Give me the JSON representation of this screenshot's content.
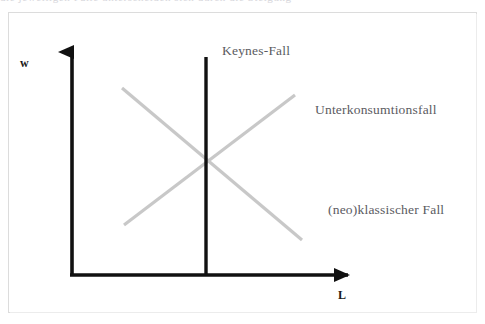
{
  "figure": {
    "kind": "economics-labour-market-diagram",
    "top_bleed_text": "die jeweiligen Fälle  unterscheiden sich durch die Steigung",
    "frame_color": "#dcdcdc",
    "background": "#ffffff"
  },
  "axes": {
    "vertical": {
      "label": "w",
      "color": "#111111",
      "x": 72,
      "y_top": 40,
      "y_bottom": 276,
      "arrow": "arrow-up"
    },
    "horizontal": {
      "label": "L",
      "color": "#111111",
      "y": 275,
      "x_left": 72,
      "x_right": 360,
      "arrow": "arrow-right"
    }
  },
  "curves": [
    {
      "name": "keynes-line",
      "description": "vertical black line",
      "color": "#111111",
      "width": 3.4,
      "x1": 206,
      "y1": 57,
      "x2": 206,
      "y2": 276
    },
    {
      "name": "labour-demand-line",
      "description": "downward sloping grey line",
      "color": "#c8c8c8",
      "width": 3.2,
      "x1": 122,
      "y1": 88,
      "x2": 302,
      "y2": 240
    },
    {
      "name": "labour-supply-line",
      "description": "upward sloping grey line",
      "color": "#c8c8c8",
      "width": 3.2,
      "x1": 124,
      "y1": 225,
      "x2": 295,
      "y2": 95
    }
  ],
  "intersection": {
    "x": 208,
    "y": 163
  },
  "labels": {
    "keynes": "Keynes-Fall",
    "unterkonsumtion": "Unterkonsumtionsfall",
    "neoklassisch": "(neo)klassischer Fall"
  },
  "colors": {
    "axis": "#111111",
    "curve_grey": "#c8c8c8",
    "label_text": "#5b5b5f",
    "axis_label_text": "#1a1a1a",
    "frame": "#dcdcdc"
  }
}
